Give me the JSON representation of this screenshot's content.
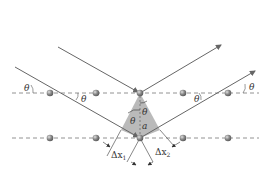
{
  "diagram": {
    "type": "bragg-diffraction",
    "colors": {
      "ray": "#666666",
      "dashed_line": "#777777",
      "atom": "#8a8a8a",
      "atom_highlight": "#d8d8d8",
      "shaded_region": "#b3b3b3",
      "text": "#333333"
    },
    "rows": [
      {
        "id": "upper",
        "y": 93,
        "atoms_x": [
          50,
          96,
          140,
          183,
          228
        ]
      },
      {
        "id": "lower",
        "y": 138,
        "atoms_x": [
          50,
          96,
          140,
          183,
          228
        ]
      }
    ],
    "rays": [
      {
        "id": "incident-upper",
        "x1": 58,
        "y1": 47,
        "x2": 140,
        "y2": 93
      },
      {
        "id": "reflected-upper",
        "x1": 140,
        "y1": 93,
        "x2": 221,
        "y2": 45
      },
      {
        "id": "incident-lower",
        "x1": 15,
        "y1": 67,
        "x2": 140,
        "y2": 138
      },
      {
        "id": "reflected-lower",
        "x1": 140,
        "y1": 138,
        "x2": 255,
        "y2": 71
      }
    ],
    "labels": {
      "theta": "θ",
      "spacing": "a",
      "delta_x1_main": "Δx",
      "delta_x1_sub": "1",
      "delta_x2_main": "Δx",
      "delta_x2_sub": "2"
    }
  }
}
